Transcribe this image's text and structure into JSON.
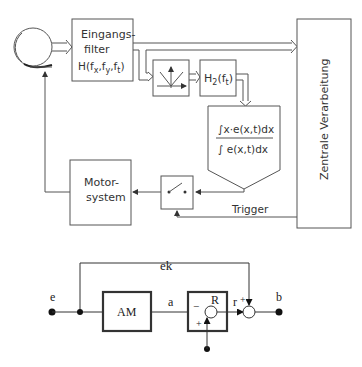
{
  "diagram_top": {
    "eye_label": "",
    "input_filter": {
      "line1": "Eingangs-",
      "line2": "filter",
      "func": "H(f",
      "sub_x": "x",
      "sep1": ",f",
      "sub_y": "y",
      "sep2": ",f",
      "sub_t": "t",
      "close": ")"
    },
    "h2_filter": {
      "func": "H",
      "sub2": "2",
      "arg_open": "(f",
      "sub_t": "t",
      "arg_close": ")"
    },
    "integral": {
      "numerator": "∫x·e(x,t)dx",
      "denominator": "∫ e(x,t)dx"
    },
    "central": "Zentrale Verarbeitung",
    "motor": {
      "line1": "Motor-",
      "line2": "system"
    },
    "trigger": "Trigger"
  },
  "diagram_bottom": {
    "ek": "ek",
    "e": "e",
    "am": "AM",
    "a": "a",
    "r_block": "R",
    "r": "r",
    "b": "b",
    "minus": "−",
    "plus1": "+",
    "plus2": "+",
    "plus3": "+"
  }
}
